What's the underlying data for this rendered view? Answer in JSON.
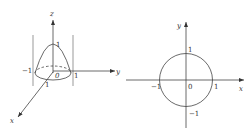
{
  "figures": [
    {
      "id": "paraboloid-3d",
      "description": "Paraboloid cap z = 1 - x^2 - y^2 over unit disk, inside cylinder x^2 + y^2 = 1",
      "axes": {
        "x": "x",
        "y": "y",
        "z": "z"
      },
      "labels": {
        "z_top": "1",
        "y_neg": "−1",
        "origin": "0",
        "y_pos": "1",
        "x_pos": "1"
      }
    },
    {
      "id": "unit-circle-2d",
      "description": "Unit circle x^2 + y^2 = 1 in the xy-plane",
      "axes": {
        "x": "x",
        "y": "y"
      },
      "labels": {
        "y_pos": "1",
        "y_neg": "−1",
        "x_neg": "−1",
        "x_pos": "1",
        "origin": "0"
      }
    }
  ],
  "colors": {
    "line": "#444444",
    "text": "#333333",
    "background": "#ffffff"
  }
}
